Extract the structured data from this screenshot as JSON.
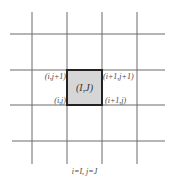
{
  "diagram": {
    "type": "grid-cell-stencil",
    "grid": {
      "vertical_lines_x": [
        32,
        67,
        102,
        137
      ],
      "horizontal_lines_y": [
        34,
        70,
        105,
        141
      ],
      "line_color": "#6a6a6a"
    },
    "highlighted_cell": {
      "label": "(I,J)",
      "fill": "#d6d6d6",
      "border": "#222222"
    },
    "corner_labels": {
      "top_left": "(i,j+1)",
      "top_right": "(i+1,j+1)",
      "bottom_left": "(i,j)",
      "bottom_right": "(i+1,j)"
    },
    "caption": "i=I, j=J"
  }
}
